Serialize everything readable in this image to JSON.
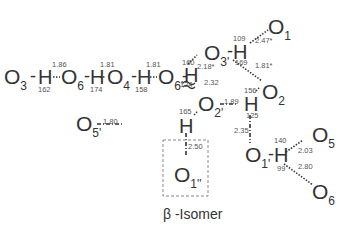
{
  "caption": "β -Isomer",
  "chain": {
    "atoms": [
      {
        "label": "O",
        "sub": "3"
      },
      {
        "label": "O",
        "sub": "6"
      },
      {
        "label": "O",
        "sub": "4"
      },
      {
        "label": "O",
        "sub": "6'"
      }
    ],
    "hydrogens": [
      "H",
      "H",
      "H",
      "H"
    ],
    "bond_dash": "-",
    "distances": [
      "1.86",
      "1.81",
      "1.81"
    ],
    "angles": [
      "162",
      "174",
      "158"
    ]
  },
  "network": {
    "O3p": {
      "label": "O",
      "sub": "3'"
    },
    "O1": {
      "label": "O",
      "sub": "1"
    },
    "O2": {
      "label": "O",
      "sub": "2"
    },
    "O2p": {
      "label": "O",
      "sub": "2'"
    },
    "O5p": {
      "label": "O",
      "sub": "5'"
    },
    "O1pp": {
      "label": "O",
      "sub": "1''"
    },
    "O1p": {
      "label": "O",
      "sub": "1'"
    },
    "O5": {
      "label": "O",
      "sub": "5"
    },
    "O6": {
      "label": "O",
      "sub": "6"
    },
    "H_O6p": {
      "label": "H",
      "angle_top": "160",
      "angle_bottom": "124",
      "d_O3p": "2.18*",
      "d_O2p": "2.32"
    },
    "H_O3p": {
      "label": "H",
      "angle_top": "109",
      "angle_bottom": "169",
      "d_O1": "2.47*",
      "d_O2": "1.81*"
    },
    "H_O2": {
      "label": "H",
      "angle_top": "156",
      "angle_bottom": "125",
      "d_O2p": "1.89",
      "d_O1p": "2.35"
    },
    "H_O2p": {
      "label": "H",
      "angle_top": "165",
      "d_O5p": "1.80",
      "d_O1pp": "2.50"
    },
    "H_O1p": {
      "label": "H",
      "angle_top": "140",
      "angle_bottom": "99",
      "d_O5": "2.03",
      "d_O6": "2.80"
    }
  }
}
